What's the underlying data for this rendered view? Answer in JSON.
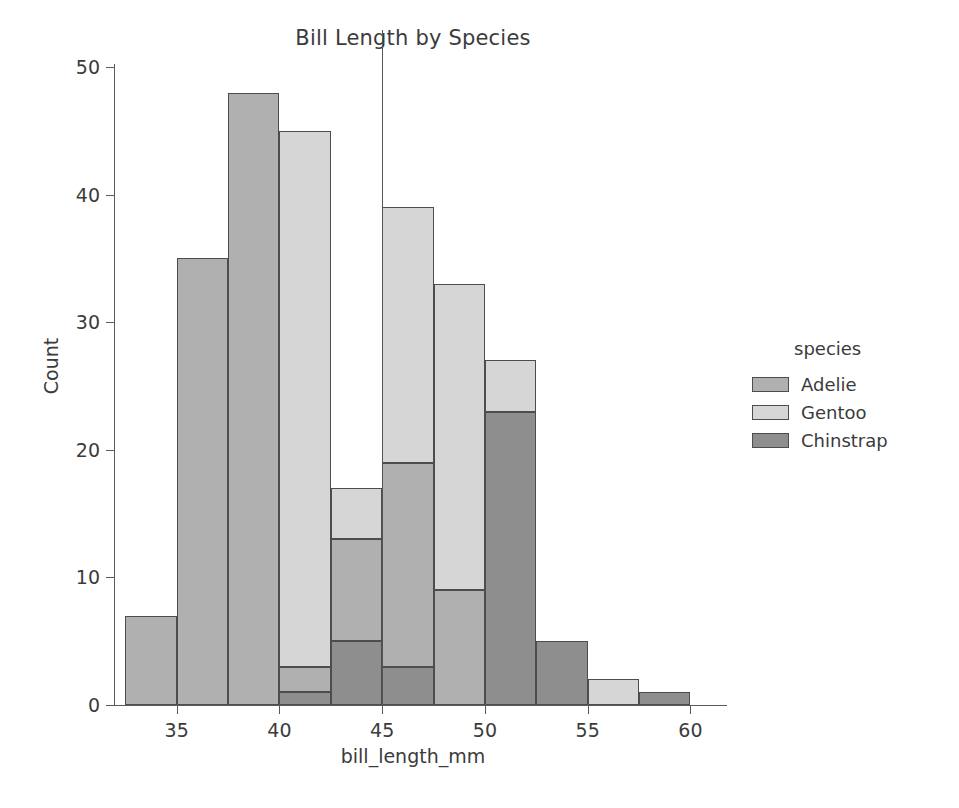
{
  "chart_data": {
    "type": "bar",
    "subtype": "stacked-histogram",
    "title": "Bill Length by Species",
    "xlabel": "bill_length_mm",
    "ylabel": "Count",
    "xlim": [
      32.0,
      61.0
    ],
    "ylim": [
      0,
      50
    ],
    "xticks": [
      "35",
      "40",
      "45",
      "50",
      "55",
      "60"
    ],
    "xtick_values": [
      35,
      40,
      45,
      50,
      55,
      60
    ],
    "yticks": [
      "0",
      "10",
      "20",
      "30",
      "40",
      "50"
    ],
    "ytick_values": [
      0,
      10,
      20,
      30,
      40,
      50
    ],
    "grid": false,
    "bin_width": 2.5,
    "bin_edges": [
      32.5,
      35.0,
      37.5,
      40.0,
      42.5,
      45.0,
      47.5,
      50.0,
      52.5,
      55.0,
      57.5,
      60.0
    ],
    "bin_centers": [
      33.75,
      36.25,
      38.75,
      41.25,
      43.75,
      46.25,
      48.75,
      51.25,
      53.75,
      56.25,
      58.75
    ],
    "series": [
      {
        "name": "Adelie",
        "color": "#b0b0b0",
        "values": [
          7,
          35,
          48,
          44,
          4,
          0,
          0,
          0,
          0,
          0,
          0
        ]
      },
      {
        "name": "Gentoo",
        "color": "#d6d6d6",
        "values": [
          0,
          0,
          0,
          0,
          4,
          20,
          24,
          4,
          0,
          2,
          0
        ]
      },
      {
        "name": "Chinstrap",
        "color": "#8e8e8e",
        "values": [
          0,
          0,
          0,
          1,
          9,
          19,
          9,
          23,
          5,
          0,
          1
        ]
      }
    ],
    "totals": [
      7,
      35,
      48,
      45,
      17,
      39,
      33,
      27,
      5,
      2,
      1
    ],
    "stack_segments": [
      {
        "bin_index": 0,
        "x0": 32.5,
        "x1": 35.0,
        "parts": [
          {
            "species": "Adelie",
            "y0": 0,
            "y1": 7
          }
        ]
      },
      {
        "bin_index": 1,
        "x0": 35.0,
        "x1": 37.5,
        "parts": [
          {
            "species": "Adelie",
            "y0": 0,
            "y1": 35
          }
        ]
      },
      {
        "bin_index": 2,
        "x0": 37.5,
        "x1": 40.0,
        "parts": [
          {
            "species": "Adelie",
            "y0": 0,
            "y1": 48
          }
        ]
      },
      {
        "bin_index": 3,
        "x0": 40.0,
        "x1": 42.5,
        "parts": [
          {
            "species": "Chinstrap",
            "y0": 0,
            "y1": 1
          },
          {
            "species": "Adelie",
            "y0": 1,
            "y1": 3
          },
          {
            "species": "Gentoo",
            "y0": 3,
            "y1": 45
          }
        ]
      },
      {
        "bin_index": 4,
        "x0": 42.5,
        "x1": 45.0,
        "parts": [
          {
            "species": "Chinstrap",
            "y0": 0,
            "y1": 5
          },
          {
            "species": "Adelie",
            "y0": 5,
            "y1": 13
          },
          {
            "species": "Gentoo",
            "y0": 13,
            "y1": 17
          }
        ]
      },
      {
        "bin_index": 5,
        "x0": 45.0,
        "x1": 47.5,
        "parts": [
          {
            "species": "Chinstrap",
            "y0": 0,
            "y1": 3
          },
          {
            "species": "Adelie",
            "y0": 3,
            "y1": 19
          },
          {
            "species": "Gentoo",
            "y0": 19,
            "y1": 39
          }
        ]
      },
      {
        "bin_index": 6,
        "x0": 47.5,
        "x1": 50.0,
        "parts": [
          {
            "species": "Adelie",
            "y0": 0,
            "y1": 9
          },
          {
            "species": "Gentoo",
            "y0": 9,
            "y1": 33
          }
        ]
      },
      {
        "bin_index": 7,
        "x0": 50.0,
        "x1": 52.5,
        "parts": [
          {
            "species": "Chinstrap",
            "y0": 0,
            "y1": 23
          },
          {
            "species": "Gentoo",
            "y0": 23,
            "y1": 27
          }
        ]
      },
      {
        "bin_index": 8,
        "x0": 52.5,
        "x1": 55.0,
        "parts": [
          {
            "species": "Chinstrap",
            "y0": 0,
            "y1": 5
          }
        ]
      },
      {
        "bin_index": 9,
        "x0": 55.0,
        "x1": 57.5,
        "parts": [
          {
            "species": "Gentoo",
            "y0": 0,
            "y1": 2
          }
        ]
      },
      {
        "bin_index": 10,
        "x0": 57.5,
        "x1": 60.0,
        "parts": [
          {
            "species": "Chinstrap",
            "y0": 0,
            "y1": 1
          }
        ]
      }
    ],
    "reference_line": {
      "x": 45.0,
      "orientation": "vertical",
      "color": "#555555"
    }
  },
  "legend": {
    "title": "species",
    "position": "right",
    "entries": [
      {
        "label": "Adelie",
        "color": "#b0b0b0"
      },
      {
        "label": "Gentoo",
        "color": "#d6d6d6"
      },
      {
        "label": "Chinstrap",
        "color": "#8e8e8e"
      }
    ]
  }
}
